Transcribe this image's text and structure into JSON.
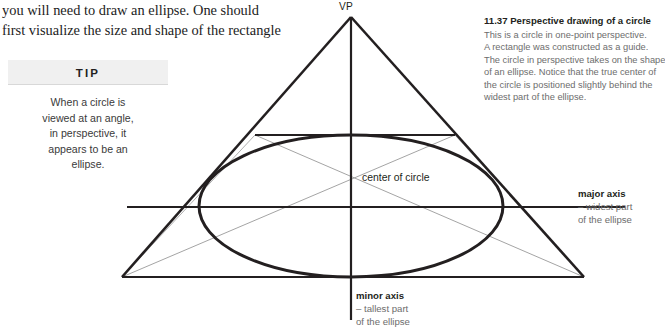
{
  "body_copy": {
    "lines": [
      "you will need to draw an ellipse. One should",
      "first visualize the size and shape of the rectangle"
    ]
  },
  "tip": {
    "header": "TIP",
    "lines": [
      "When a circle is",
      "viewed at an angle,",
      "in perspective, it",
      "appears to be an",
      "ellipse."
    ]
  },
  "caption": {
    "figure_number": "11.37",
    "title": "Perspective drawing of a circle",
    "lines": [
      "This is a circle in one-point perspective.",
      "A rectangle was constructed as a guide.",
      "The circle in perspective takes on the shape",
      "of an ellipse. Notice that the true center of",
      "the circle is positioned slightly behind the",
      "widest part of the ellipse."
    ]
  },
  "diagram": {
    "vanishing_point_label": "VP",
    "center_label": "center of circle",
    "major_axis": {
      "title": "major axis",
      "sub_line_1": "– widest part",
      "sub_line_2": "of the ellipse"
    },
    "minor_axis": {
      "title": "minor axis",
      "sub_line_1": "– tallest part",
      "sub_line_2": "of the ellipse"
    },
    "colors": {
      "heavy_stroke": "#231f20",
      "guide_stroke": "#9a9a9a",
      "background": "#ffffff",
      "muted_text": "#6d6d6d"
    },
    "geometry": {
      "apex": [
        351,
        17
      ],
      "base_left": [
        122,
        277
      ],
      "base_right": [
        584,
        277
      ],
      "rect_top_y": 135,
      "rect_top_left_x": 255,
      "rect_top_right_x": 455,
      "major_axis_y": 207,
      "major_axis_x_start": 127,
      "major_axis_x_end": 625,
      "minor_axis_x": 351,
      "minor_axis_y_end": 320,
      "ellipse_center": [
        351,
        206
      ],
      "ellipse_rx": 152,
      "ellipse_ry": 71,
      "true_center": [
        351,
        178
      ]
    }
  }
}
